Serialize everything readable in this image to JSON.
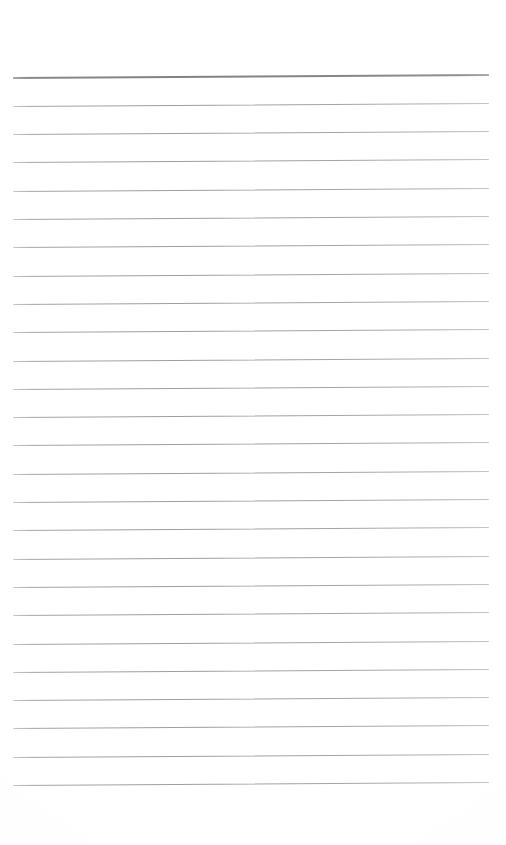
{
  "document": {
    "kind": "ruled-note-paper",
    "title": "Blank Lined Note Paper",
    "page_width": 506,
    "page_height": 845,
    "background_color": "#ffffff",
    "content_text": "",
    "notes": "Scanned blank ruled sheet. No text, headings, labels or numbers appear anywhere on the page."
  },
  "ruling": {
    "total_lines": 26,
    "line_spacing_px": 28.3,
    "first_line_y": 78,
    "last_line_y": 790,
    "left_margin_x": 13,
    "right_margin_x": 489,
    "line_length_px": 476,
    "skew_degrees": -0.36,
    "header_rule": {
      "index": 0,
      "thickness_px": 2,
      "color": "#878787",
      "description": "topmost rule, noticeably darker and thicker than the rest"
    },
    "body_rule": {
      "thickness_px": 1,
      "color": "#a6a6a6",
      "description": "uniform thin light-grey horizontal rules"
    },
    "top_blank_margin_px": 78,
    "bottom_blank_margin_px": 55
  },
  "lines": [
    {
      "index": 0,
      "y": 78.0,
      "weight": "header"
    },
    {
      "index": 1,
      "y": 106.3,
      "weight": "body"
    },
    {
      "index": 2,
      "y": 134.6,
      "weight": "body"
    },
    {
      "index": 3,
      "y": 162.9,
      "weight": "body"
    },
    {
      "index": 4,
      "y": 191.2,
      "weight": "body"
    },
    {
      "index": 5,
      "y": 219.5,
      "weight": "body"
    },
    {
      "index": 6,
      "y": 247.8,
      "weight": "body"
    },
    {
      "index": 7,
      "y": 276.1,
      "weight": "body"
    },
    {
      "index": 8,
      "y": 304.4,
      "weight": "body"
    },
    {
      "index": 9,
      "y": 332.7,
      "weight": "body"
    },
    {
      "index": 10,
      "y": 361.0,
      "weight": "body"
    },
    {
      "index": 11,
      "y": 389.3,
      "weight": "body"
    },
    {
      "index": 12,
      "y": 417.6,
      "weight": "body"
    },
    {
      "index": 13,
      "y": 445.9,
      "weight": "body"
    },
    {
      "index": 14,
      "y": 474.2,
      "weight": "body"
    },
    {
      "index": 15,
      "y": 502.5,
      "weight": "body"
    },
    {
      "index": 16,
      "y": 530.8,
      "weight": "body"
    },
    {
      "index": 17,
      "y": 559.1,
      "weight": "body"
    },
    {
      "index": 18,
      "y": 587.4,
      "weight": "body"
    },
    {
      "index": 19,
      "y": 615.7,
      "weight": "body"
    },
    {
      "index": 20,
      "y": 644.0,
      "weight": "body"
    },
    {
      "index": 21,
      "y": 672.3,
      "weight": "body"
    },
    {
      "index": 22,
      "y": 700.6,
      "weight": "body"
    },
    {
      "index": 23,
      "y": 728.9,
      "weight": "body"
    },
    {
      "index": 24,
      "y": 757.2,
      "weight": "body"
    },
    {
      "index": 25,
      "y": 785.5,
      "weight": "body"
    }
  ]
}
